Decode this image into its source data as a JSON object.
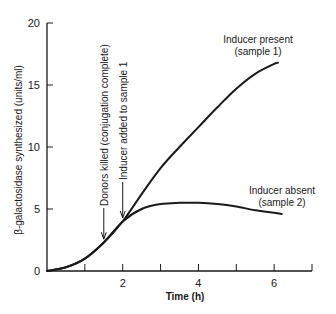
{
  "chart_data": {
    "type": "line",
    "title": "",
    "xlabel": "Time (h)",
    "ylabel": "β-galactosidase synthesized (units/ml)",
    "xlim": [
      0,
      7
    ],
    "ylim": [
      0,
      20
    ],
    "x_ticks": [
      0,
      1,
      2,
      3,
      4,
      5,
      6,
      7
    ],
    "x_tick_labels": [
      "0",
      "",
      "2",
      "",
      "4",
      "",
      "6",
      ""
    ],
    "y_ticks": [
      0,
      5,
      10,
      15,
      20
    ],
    "y_tick_labels": [
      "0",
      "5",
      "10",
      "15",
      "20"
    ],
    "grid": false,
    "series": [
      {
        "name": "Inducer present (sample 1)",
        "label_lines": [
          "Inducer present",
          "(sample 1)"
        ],
        "x": [
          0,
          0.5,
          1.0,
          1.5,
          2.0,
          2.5,
          3.0,
          3.5,
          4.0,
          4.5,
          5.0,
          5.5,
          6.0,
          6.1
        ],
        "y": [
          0,
          0.3,
          1.0,
          2.3,
          4.0,
          6.2,
          8.3,
          10.0,
          11.6,
          13.2,
          14.7,
          15.9,
          16.7,
          16.8
        ]
      },
      {
        "name": "Inducer absent (sample 2)",
        "label_lines": [
          "Inducer absent",
          "(sample 2)"
        ],
        "x": [
          0,
          0.5,
          1.0,
          1.5,
          2.0,
          2.5,
          3.0,
          3.5,
          4.0,
          4.5,
          5.0,
          5.5,
          6.0,
          6.2
        ],
        "y": [
          0,
          0.3,
          1.0,
          2.3,
          4.0,
          5.0,
          5.4,
          5.5,
          5.5,
          5.4,
          5.2,
          4.9,
          4.7,
          4.6
        ]
      }
    ],
    "annotations": [
      {
        "text": "Donors killed (conjugation complete)",
        "x": 1.5,
        "y": 2.4,
        "type": "vertical-arrow"
      },
      {
        "text": "Inducer added to sample 1",
        "x": 2.0,
        "y": 4.2,
        "type": "vertical-arrow"
      }
    ],
    "legend": "inline labels at curve ends"
  },
  "labels": {
    "xlabel": "Time (h)",
    "ylabel": "β-galactosidase synthesized (units/ml)",
    "present_line1": "Inducer present",
    "present_line2": "(sample 1)",
    "absent_line1": "Inducer absent",
    "absent_line2": "(sample 2)",
    "annot_donors": "Donors killed (conjugation complete)",
    "annot_inducer": "Inducer added to sample 1"
  },
  "colors": {
    "line": "#1a1a1a",
    "axis": "#1a1a1a",
    "background": "#ffffff"
  }
}
